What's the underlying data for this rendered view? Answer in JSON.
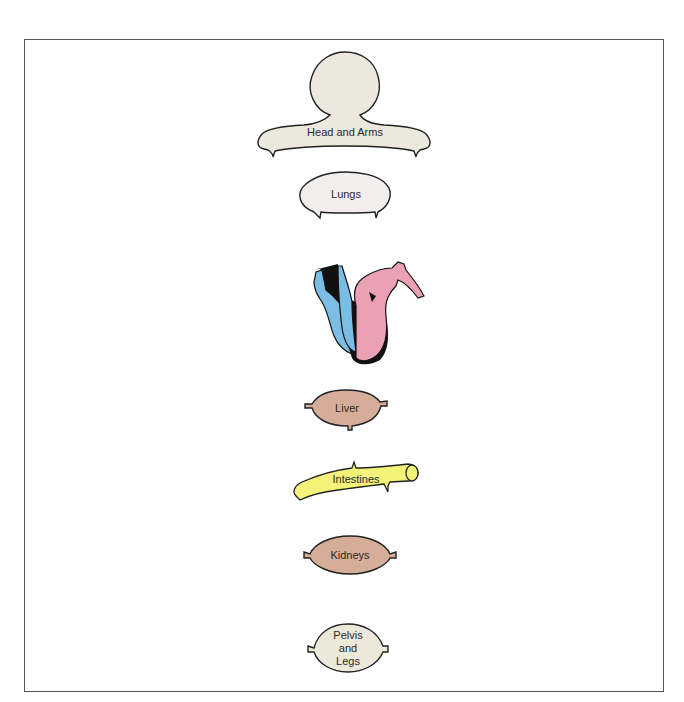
{
  "diagram": {
    "type": "circulatory-system-schematic",
    "organs": [
      {
        "id": "head-arms",
        "label": "Head and Arms",
        "fill": "#ede8de"
      },
      {
        "id": "lungs",
        "label": "Lungs",
        "fill": "#f2eeee"
      },
      {
        "id": "heart",
        "label": "",
        "fill_right": "#7cbde6",
        "fill_left": "#e9a1b3"
      },
      {
        "id": "liver",
        "label": "Liver",
        "fill": "#d6ad98"
      },
      {
        "id": "intestines",
        "label": "Intestines",
        "fill": "#f3f37a"
      },
      {
        "id": "kidneys",
        "label": "Kidneys",
        "fill": "#d6ad98"
      },
      {
        "id": "pelvis-legs",
        "label_lines": [
          "Pelvis",
          "and",
          "Legs"
        ],
        "fill": "#ece8da"
      }
    ]
  }
}
